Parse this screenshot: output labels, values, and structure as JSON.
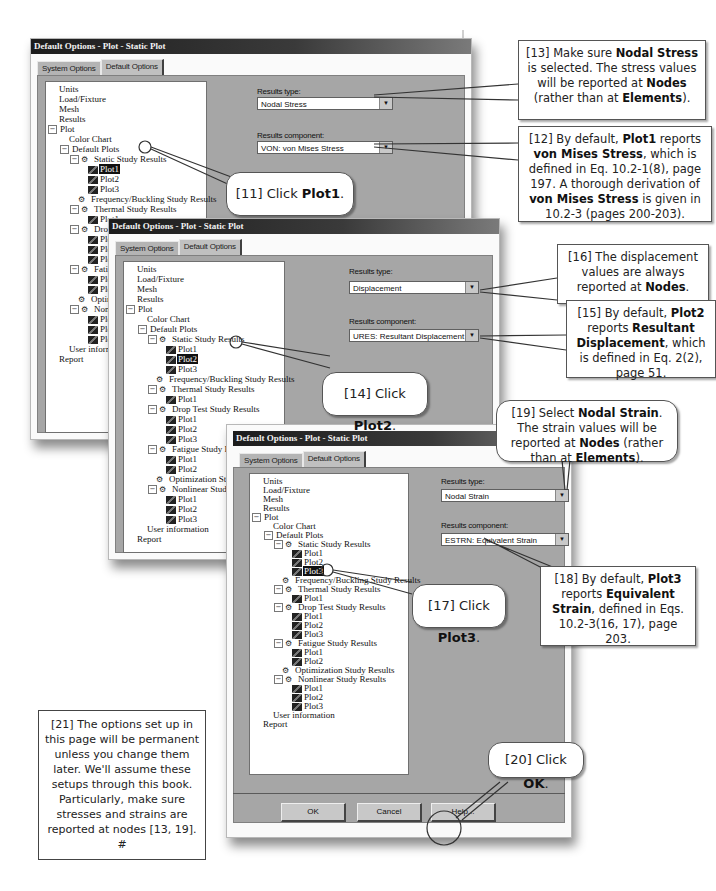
{
  "dialogs": [
    {
      "title": "Default Options - Plot - Static Plot",
      "tabs": [
        "System Options",
        "Default Options"
      ],
      "active_tab": "Default Options",
      "results_type_label": "Results type:",
      "results_type_value": "Nodal Stress",
      "results_component_label": "Results component:",
      "results_component_value": "VON: von Mises Stress",
      "selected_plot": "Plot1"
    },
    {
      "title": "Default Options - Plot - Static Plot",
      "tabs": [
        "System Options",
        "Default Options"
      ],
      "active_tab": "Default Options",
      "results_type_label": "Results type:",
      "results_type_value": "Displacement",
      "results_component_label": "Results component:",
      "results_component_value": "URES: Resultant Displacement",
      "selected_plot": "Plot2"
    },
    {
      "title": "Default Options - Plot - Static Plot",
      "tabs": [
        "System Options",
        "Default Options"
      ],
      "active_tab": "Default Options",
      "results_type_label": "Results type:",
      "results_type_value": "Nodal Strain",
      "results_component_label": "Results component:",
      "results_component_value": "ESTRN: Equivalent Strain",
      "selected_plot": "Plot3",
      "buttons": {
        "ok": "OK",
        "cancel": "Cancel",
        "help": "Help..."
      }
    }
  ],
  "tree": {
    "units": "Units",
    "load_fixture": "Load/Fixture",
    "mesh": "Mesh",
    "results": "Results",
    "plot": "Plot",
    "color_chart": "Color Chart",
    "default_plots": "Default Plots",
    "static": "Static Study Results",
    "frequency": "Frequency/Buckling Study Results",
    "thermal": "Thermal Study Results",
    "drop_test": "Drop Test Study Results",
    "fatigue": "Fatigue Study Results",
    "optimization": "Optimization Study Results",
    "nonlinear": "Nonlinear Study Results",
    "plot1": "Plot1",
    "plot2": "Plot2",
    "plot3": "Plot3",
    "user_information": "User information",
    "report": "Report"
  },
  "callouts": {
    "c11": {
      "pre": "[11] Click ",
      "bold": "Plot1",
      "post": "."
    },
    "c12": {
      "t1": "[12] By default, ",
      "b1": "Plot1",
      "t2": " reports ",
      "b2": "von Mises Stress",
      "t3": ", which is defined in Eq. 10.2-1(8), page 197. A thorough derivation of ",
      "b3": "von Mises Stress",
      "t4": " is given in 10.2-3 (pages 200-203)."
    },
    "c13": {
      "t1": "[13] Make sure ",
      "b1": "Nodal Stress",
      "t2": " is selected. The stress values will be reported at ",
      "b2": "Nodes",
      "t3": " (rather than at ",
      "b3": "Elements",
      "t4": ")."
    },
    "c14": {
      "pre": "[14] Click ",
      "bold": "Plot2",
      "post": "."
    },
    "c15": {
      "t1": "[15] By default, ",
      "b1": "Plot2",
      "t2": " reports ",
      "b2": "Resultant Displacement",
      "t3": ", which is defined in Eq. 2(2), page 51."
    },
    "c16": {
      "t1": "[16] The displacement values are always reported at ",
      "b1": "Nodes",
      "t2": "."
    },
    "c17": {
      "pre": "[17] Click ",
      "bold": "Plot3",
      "post": "."
    },
    "c18": {
      "t1": "[18] By default, ",
      "b1": "Plot3",
      "t2": " reports ",
      "b2": "Equivalent Strain",
      "t3": ", defined in Eqs. 10.2-3(16, 17), page 203."
    },
    "c19": {
      "t1": "[19] Select ",
      "b1": "Nodal Strain",
      "t2": ". The strain values will be reported at ",
      "b2": "Nodes",
      "t3": " (rather than at ",
      "b3": "Elements",
      "t4": ")."
    },
    "c20": {
      "pre": "[20] Click ",
      "bold": "OK",
      "post": "."
    },
    "c21": "[21] The options set up in this page will be permanent unless you change them later. We'll assume these setups through this book. Particularly, make sure stresses and strains are reported at nodes [13, 19]. #"
  }
}
